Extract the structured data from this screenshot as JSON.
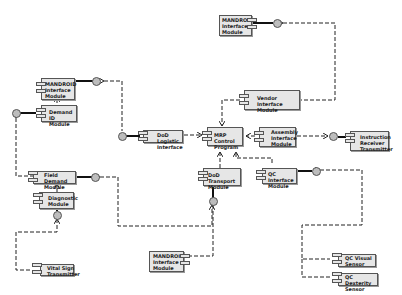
{
  "diagram": {
    "type": "UML component diagram",
    "colors": {
      "component_fill": "#e6e6e6",
      "border": "#555555",
      "interface_fill": "#bdbdbd",
      "line": "#222222"
    },
    "components": [
      {
        "id": "mandroid_top_left",
        "label": "MANDROID\nInterface\nModule"
      },
      {
        "id": "demand_id",
        "label": "Demand ID\nModule"
      },
      {
        "id": "mandroid_top_right",
        "label": "MANDROID\nInterface\nModule"
      },
      {
        "id": "vendor_interface",
        "label": "Vendor Interface\nModule"
      },
      {
        "id": "dod_logistic",
        "label": "DoD Logistic\nInterface"
      },
      {
        "id": "mrp_control",
        "label": "MRP Control\nProgram"
      },
      {
        "id": "assembly_interface",
        "label": "Assembly\nInterface\nModule"
      },
      {
        "id": "instruction_receiver",
        "label": "Instruction\nReceiver\nTransmitter"
      },
      {
        "id": "field_demand",
        "label": "Field Demand\nModule"
      },
      {
        "id": "diagnostic",
        "label": "Diagnostic\nModule"
      },
      {
        "id": "dod_transport",
        "label": "DoD Transport\nModule"
      },
      {
        "id": "qc_interface",
        "label": "QC Interface\nModule"
      },
      {
        "id": "vital_sign",
        "label": "Vital Sign\nTransmitter"
      },
      {
        "id": "mandroid_bottom",
        "label": "MANDROID\nInterface\nModule"
      },
      {
        "id": "qc_visual",
        "label": "QC Visual\nSensor"
      },
      {
        "id": "qc_dexterity",
        "label": "QC Dexterity\nSensor"
      }
    ]
  }
}
